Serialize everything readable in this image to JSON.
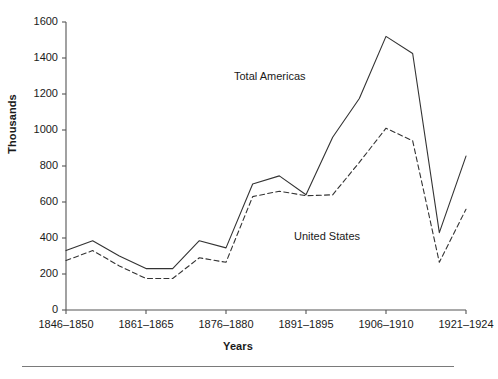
{
  "chart_data": {
    "type": "line",
    "title": "",
    "xlabel": "Years",
    "ylabel": "Thousands",
    "ylim": [
      0,
      1600
    ],
    "ytick_step": 200,
    "yticks": [
      0,
      200,
      400,
      600,
      800,
      1000,
      1200,
      1400,
      1600
    ],
    "grid": false,
    "legend_position": "inline-annotations",
    "categories": [
      "1846-1850",
      "1851-1855",
      "1856-1860",
      "1861-1865",
      "1866-1870",
      "1871-1875",
      "1876-1880",
      "1881-1885",
      "1886-1890",
      "1891-1895",
      "1896-1900",
      "1901-1905",
      "1906-1910",
      "1911-1915",
      "1916-1920",
      "1921-1924"
    ],
    "xtick_labels": [
      "1846–1850",
      "1861–1865",
      "1876–1880",
      "1891–1895",
      "1906–1910",
      "1921–1924"
    ],
    "xtick_indices": [
      0,
      3,
      6,
      9,
      12,
      15
    ],
    "series": [
      {
        "name": "Total Americas",
        "style": "solid",
        "color": "#333333",
        "values": [
          330,
          385,
          300,
          230,
          230,
          385,
          345,
          700,
          745,
          640,
          960,
          1175,
          1520,
          1425,
          430,
          855
        ]
      },
      {
        "name": "United States",
        "style": "dashed",
        "color": "#333333",
        "values": [
          275,
          330,
          245,
          175,
          175,
          290,
          265,
          630,
          660,
          635,
          640,
          820,
          1010,
          940,
          265,
          560
        ]
      }
    ],
    "annotations": [
      {
        "text": "Total Americas",
        "series": "Total Americas"
      },
      {
        "text": "United States",
        "series": "United States"
      }
    ]
  },
  "axis": {
    "y_title": "Thousands",
    "x_title": "Years"
  },
  "colors": {
    "axis_line": "#555555",
    "series_line": "#333333",
    "text": "#1a1a1a",
    "rule": "#7a7a7a",
    "background": "#ffffff"
  }
}
